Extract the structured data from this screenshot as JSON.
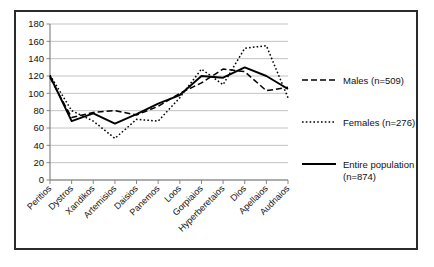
{
  "chart_data": {
    "type": "line",
    "title": "",
    "xlabel": "",
    "ylabel": "",
    "ylim": [
      0,
      180
    ],
    "ytick_step": 20,
    "grid": true,
    "legend_position": "right",
    "categories": [
      "Peritios",
      "Dystros",
      "Xandikos",
      "Artemisios",
      "Daisios",
      "Panemos",
      "Loos",
      "Gorpiaios",
      "Hyperberetaios",
      "Dios",
      "Apellaios",
      "Audnaios"
    ],
    "ytick_labels": [
      "0",
      "20",
      "40",
      "60",
      "80",
      "100",
      "120",
      "140",
      "160",
      "180"
    ],
    "series": [
      {
        "name": "Males (n=509)",
        "style": "dashed",
        "values": [
          118,
          72,
          78,
          80,
          75,
          85,
          100,
          112,
          128,
          125,
          103,
          107
        ]
      },
      {
        "name": "Females (n=276)",
        "style": "dotted",
        "values": [
          121,
          80,
          68,
          48,
          70,
          68,
          95,
          128,
          110,
          152,
          155,
          95
        ]
      },
      {
        "name": "Entire population (n=874)",
        "style": "solid",
        "values": [
          120,
          68,
          77,
          65,
          76,
          88,
          98,
          120,
          118,
          130,
          120,
          105
        ]
      }
    ]
  },
  "legend": {
    "items": [
      {
        "label": "Males (n=509)",
        "style": "dashed"
      },
      {
        "label": "Females (n=276)",
        "style": "dotted"
      },
      {
        "label": "Entire population",
        "label2": "(n=874)",
        "style": "solid"
      }
    ]
  },
  "colors": {
    "frame": "#2b2b2b",
    "grid": "#b4b4b4",
    "axis": "#7a7a7a",
    "series": "#000000",
    "background": "#ffffff"
  }
}
